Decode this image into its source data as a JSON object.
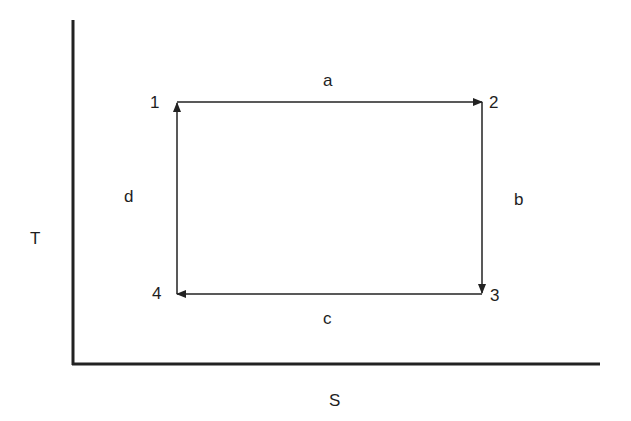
{
  "diagram": {
    "type": "T-S diagram (Carnot cycle)",
    "axes": {
      "y_label": "T",
      "x_label": "S"
    },
    "states": [
      {
        "id": "1",
        "label": "1",
        "position": "top-left"
      },
      {
        "id": "2",
        "label": "2",
        "position": "top-right"
      },
      {
        "id": "3",
        "label": "3",
        "position": "bottom-right"
      },
      {
        "id": "4",
        "label": "4",
        "position": "bottom-left"
      }
    ],
    "processes": [
      {
        "label": "a",
        "from": "1",
        "to": "2",
        "direction": "right"
      },
      {
        "label": "b",
        "from": "2",
        "to": "3",
        "direction": "down"
      },
      {
        "label": "c",
        "from": "3",
        "to": "4",
        "direction": "left"
      },
      {
        "label": "d",
        "from": "4",
        "to": "1",
        "direction": "up"
      }
    ],
    "colors": {
      "line": "#222222",
      "background": "#ffffff"
    }
  }
}
